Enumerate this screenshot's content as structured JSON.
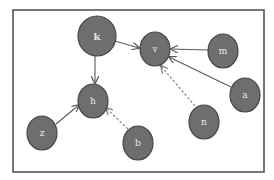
{
  "diagram": {
    "type": "directed-graph",
    "frame": {
      "x": 13,
      "y": 10,
      "width": 251,
      "height": 162
    },
    "colors": {
      "node_fill": "#6e6e6e",
      "node_stroke": "#474747",
      "label": "#e8e8e8",
      "edge": "#5a5a5a",
      "dashed_edge": "#7a7a7a",
      "frame": "#555555"
    },
    "nodes": [
      {
        "id": "k",
        "label": "k",
        "cx": 97,
        "cy": 36,
        "rx": 19,
        "ry": 20
      },
      {
        "id": "v",
        "label": "v",
        "cx": 155,
        "cy": 49,
        "rx": 15,
        "ry": 17
      },
      {
        "id": "m",
        "label": "m",
        "cx": 223,
        "cy": 51,
        "rx": 15,
        "ry": 17
      },
      {
        "id": "a",
        "label": "a",
        "cx": 245,
        "cy": 95,
        "rx": 15,
        "ry": 17
      },
      {
        "id": "h",
        "label": "h",
        "cx": 93,
        "cy": 101,
        "rx": 15,
        "ry": 17
      },
      {
        "id": "n",
        "label": "n",
        "cx": 204,
        "cy": 122,
        "rx": 15,
        "ry": 17
      },
      {
        "id": "z",
        "label": "z",
        "cx": 42,
        "cy": 133,
        "rx": 15,
        "ry": 17
      },
      {
        "id": "b",
        "label": "b",
        "cx": 138,
        "cy": 143,
        "rx": 15,
        "ry": 17
      }
    ],
    "edges": [
      {
        "from": "k",
        "to": "v",
        "style": "solid"
      },
      {
        "from": "m",
        "to": "v",
        "style": "solid"
      },
      {
        "from": "a",
        "to": "v",
        "style": "solid"
      },
      {
        "from": "n",
        "to": "v",
        "style": "dashed"
      },
      {
        "from": "k",
        "to": "h",
        "style": "solid"
      },
      {
        "from": "z",
        "to": "h",
        "style": "solid"
      },
      {
        "from": "b",
        "to": "h",
        "style": "dashed"
      }
    ]
  }
}
